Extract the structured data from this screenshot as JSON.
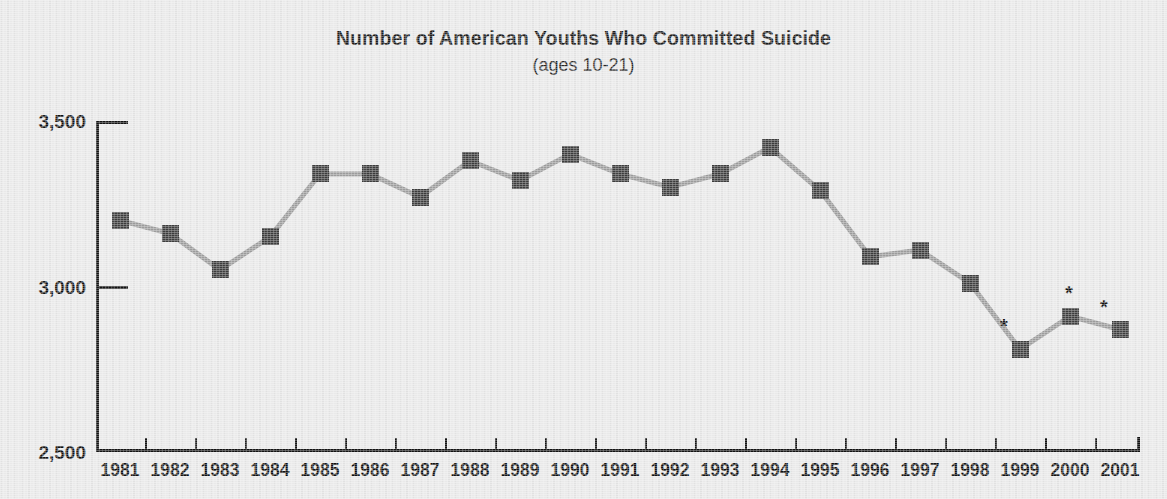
{
  "title": "Number of American Youths Who Committed Suicide",
  "subtitle": "(ages 10-21)",
  "chart_data": {
    "type": "line",
    "title": "Number of American Youths Who Committed Suicide",
    "subtitle": "(ages 10-21)",
    "xlabel": "",
    "ylabel": "",
    "ylim": [
      2500,
      3500
    ],
    "yticks": [
      2500,
      3000,
      3500
    ],
    "ytick_labels": [
      "2,500",
      "3,000",
      "3,500"
    ],
    "grid": false,
    "legend": "none",
    "marker": "square",
    "marker_color": "#3b3b3b",
    "line_color": "#9b9b9b",
    "categories": [
      "1981",
      "1982",
      "1983",
      "1984",
      "1985",
      "1986",
      "1987",
      "1988",
      "1989",
      "1990",
      "1991",
      "1992",
      "1993",
      "1994",
      "1995",
      "1996",
      "1997",
      "1998",
      "1999",
      "2000",
      "2001"
    ],
    "values": [
      3200,
      3160,
      3050,
      3150,
      3340,
      3340,
      3270,
      3380,
      3320,
      3400,
      3340,
      3300,
      3340,
      3420,
      3290,
      3090,
      3110,
      3010,
      2810,
      2910,
      2870
    ],
    "annotations": [
      {
        "category": "1999",
        "symbol": "*"
      },
      {
        "category": "2000",
        "symbol": "*"
      },
      {
        "category": "2001",
        "symbol": "*"
      }
    ]
  }
}
